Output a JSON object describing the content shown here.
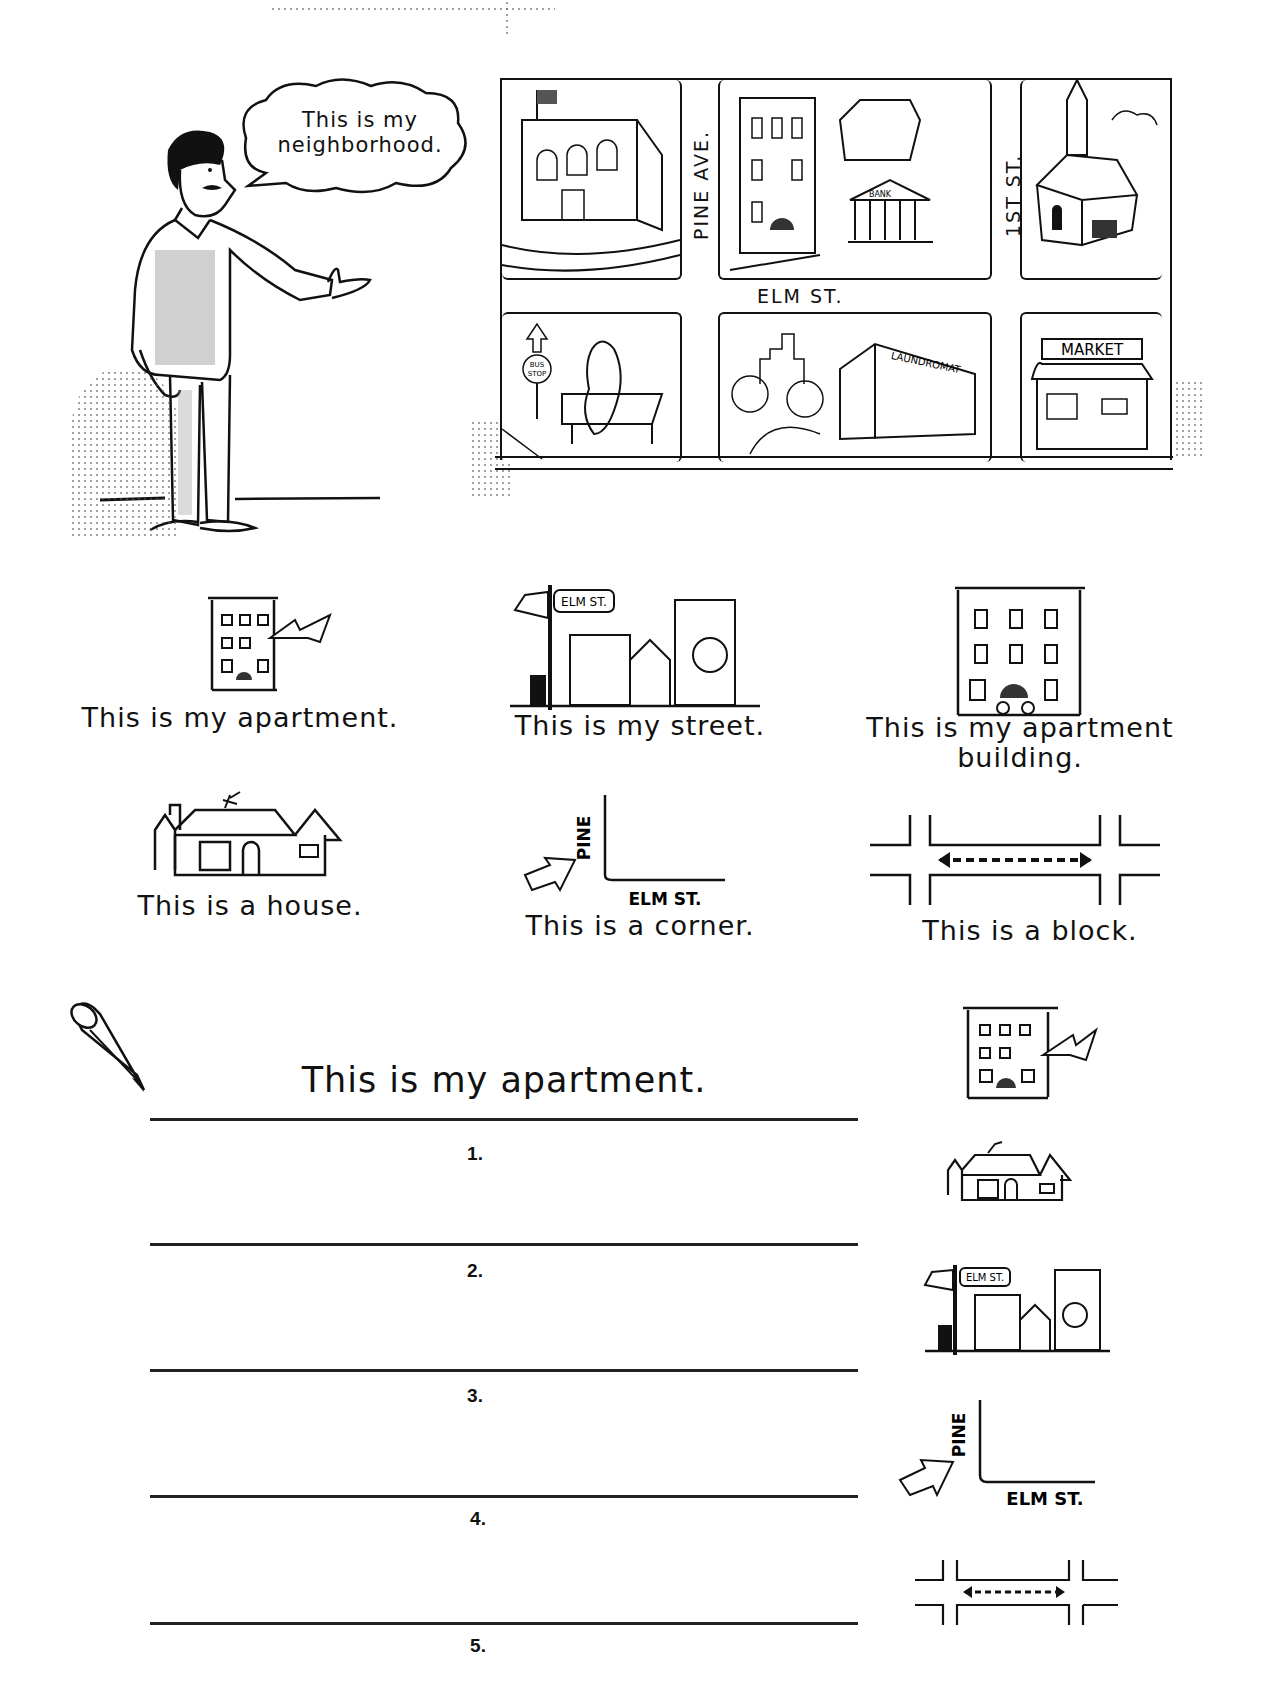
{
  "header": {
    "speech_bubble": [
      "This is my",
      "neighborhood."
    ]
  },
  "map": {
    "streets": {
      "horizontal": "ELM ST.",
      "vertical_left": "PINE AVE.",
      "vertical_right": "1ST ST."
    },
    "buildings": {
      "bank": "BANK",
      "bus_stop": [
        "BUS",
        "STOP"
      ],
      "laundromat": "LAUNDROMAT",
      "market": "MARKET"
    }
  },
  "vocabulary": [
    {
      "caption": "This is my apartment.",
      "icon": "apartment-icon"
    },
    {
      "caption": "This is my street.",
      "icon": "street-icon"
    },
    {
      "caption": [
        "This is my apartment",
        "building."
      ],
      "icon": "apartment-building-icon"
    },
    {
      "caption": "This is a house.",
      "icon": "house-icon"
    },
    {
      "caption": "This is a corner.",
      "icon": "corner-icon"
    },
    {
      "caption": "This is a block.",
      "icon": "block-icon"
    }
  ],
  "icon_labels": {
    "elm": "ELM ST.",
    "pine": "PINE",
    "elm_corner": "ELM ST."
  },
  "exercise": {
    "example": "This is my apartment.",
    "numbers": [
      "1.",
      "2.",
      "3.",
      "4.",
      "5."
    ]
  }
}
